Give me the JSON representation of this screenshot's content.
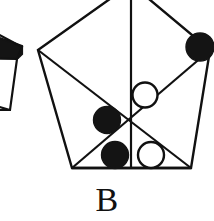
{
  "figure": {
    "caption": "B",
    "background_color": "#ffffff",
    "stroke_color": "#111111",
    "fill_white": "#ffffff",
    "fill_black": "#141414",
    "stroke_width": 2.2,
    "canvas": {
      "width": 214,
      "height": 221
    },
    "main_shape": {
      "name": "pentagon",
      "vertices": [
        {
          "label": "top",
          "x": 131,
          "y": -16
        },
        {
          "label": "right",
          "x": 210,
          "y": 50
        },
        {
          "label": "bottom-right",
          "x": 191,
          "y": 168
        },
        {
          "label": "bottom-left",
          "x": 72,
          "y": 168
        },
        {
          "label": "left",
          "x": 38,
          "y": 50
        }
      ],
      "center": {
        "x": 131,
        "y": 124
      }
    },
    "inner_lines": [
      {
        "name": "chord-left-to-center",
        "x1": 38,
        "y1": 50,
        "x2": 191,
        "y2": 168
      },
      {
        "name": "chord-right-to-center",
        "x1": 210,
        "y1": 50,
        "x2": 72,
        "y2": 168
      },
      {
        "name": "axis-vertical",
        "x1": 131,
        "y1": -16,
        "x2": 131,
        "y2": 168
      },
      {
        "name": "base-bottom",
        "x1": 72,
        "y1": 168,
        "x2": 191,
        "y2": 168
      }
    ],
    "tokens": [
      {
        "name": "token-black-top-right",
        "color": "black",
        "cx": 200,
        "cy": 47,
        "r": 14
      },
      {
        "name": "token-white-upper-center",
        "color": "white",
        "cx": 145,
        "cy": 95,
        "r": 12.5
      },
      {
        "name": "token-black-middle-left",
        "color": "black",
        "cx": 107,
        "cy": 120,
        "r": 13.5
      },
      {
        "name": "token-black-bottom-left",
        "color": "black",
        "cx": 115,
        "cy": 155,
        "r": 13.5
      },
      {
        "name": "token-white-bottom-center",
        "color": "white",
        "cx": 151,
        "cy": 155,
        "r": 13
      }
    ],
    "partial_shape": {
      "name": "partial-pentagon-left-edge",
      "description": "cropped neighbouring figure at left edge",
      "outline": "M -34 50 L 22 50 L 14 108 L -28 108 Z",
      "wedge": "M -34 10 L 22 50 L -34 88 Z"
    }
  }
}
